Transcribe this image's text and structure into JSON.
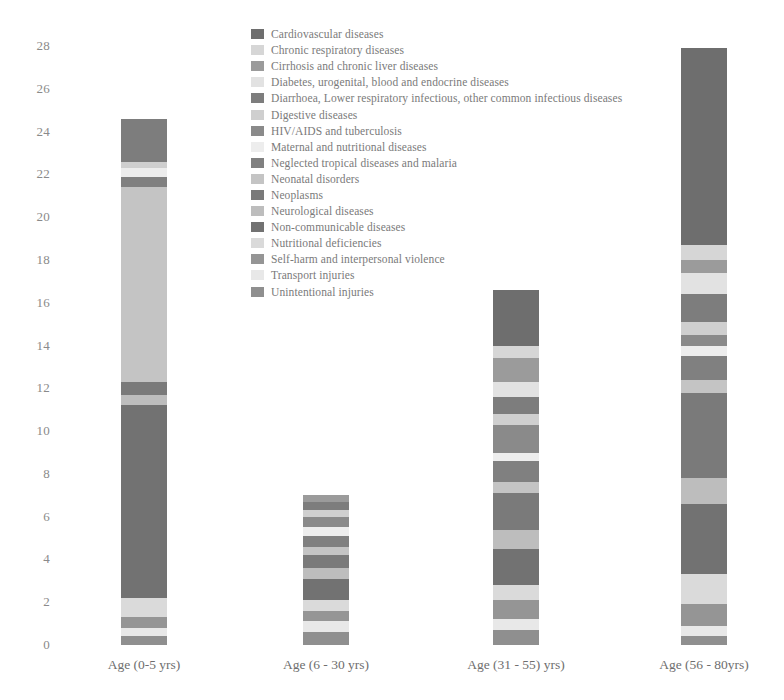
{
  "chart_data": {
    "type": "bar",
    "stacked": true,
    "title": "",
    "xlabel": "",
    "ylabel": "",
    "ylim": [
      0,
      28
    ],
    "ytick_step": 2,
    "grid": false,
    "legend_position": "top-center",
    "ytick_labels": [
      "28",
      "26",
      "24",
      "22",
      "20",
      "18",
      "16",
      "14",
      "12",
      "10",
      "8",
      "6",
      "4",
      "2",
      "0"
    ],
    "categories": [
      "Age (0-5 yrs)",
      "Age (6 - 30 yrs)",
      "Age (31 - 55) yrs)",
      "Age (56 - 80yrs)"
    ],
    "series": [
      {
        "name": "Cardiovascular diseases",
        "color": "#6e6e6e",
        "values": [
          0.0,
          0.0,
          2.6,
          9.2
        ]
      },
      {
        "name": "Chronic respiratory diseases",
        "color": "#d6d6d6",
        "values": [
          0.0,
          0.0,
          0.6,
          0.7
        ]
      },
      {
        "name": "Cirrhosis and chronic liver diseases",
        "color": "#9b9b9b",
        "values": [
          0.0,
          0.3,
          1.1,
          0.6
        ]
      },
      {
        "name": "Diabetes, urogenital, blood and endocrine diseases",
        "color": "#e2e2e2",
        "values": [
          0.0,
          0.0,
          0.7,
          1.0
        ]
      },
      {
        "name": "Diarrhoea, Lower respiratory infectious, other common infectious diseases",
        "color": "#7d7d7d",
        "values": [
          2.0,
          0.4,
          0.8,
          1.3
        ]
      },
      {
        "name": "Digestive diseases",
        "color": "#cfcfcf",
        "values": [
          0.3,
          0.3,
          0.5,
          0.6
        ]
      },
      {
        "name": "HIV/AIDS and tuberculosis",
        "color": "#8a8a8a",
        "values": [
          0.0,
          0.5,
          1.3,
          0.5
        ]
      },
      {
        "name": "Maternal and nutritional diseases",
        "color": "#ededed",
        "values": [
          0.4,
          0.4,
          0.4,
          0.5
        ]
      },
      {
        "name": "Neglected tropical diseases and malaria",
        "color": "#808080",
        "values": [
          0.5,
          0.5,
          1.0,
          1.1
        ]
      },
      {
        "name": "Neonatal disorders",
        "color": "#c4c4c4",
        "values": [
          9.1,
          0.4,
          0.5,
          0.6
        ]
      },
      {
        "name": "Neoplasms",
        "color": "#7a7a7a",
        "values": [
          0.6,
          0.6,
          1.7,
          4.0
        ]
      },
      {
        "name": "Neurological diseases",
        "color": "#bdbdbd",
        "values": [
          0.5,
          0.5,
          0.9,
          1.2
        ]
      },
      {
        "name": "Non-communicable diseases",
        "color": "#727272",
        "values": [
          9.0,
          1.0,
          1.7,
          3.3
        ]
      },
      {
        "name": "Nutritional deficiencies",
        "color": "#dadada",
        "values": [
          0.9,
          0.5,
          0.7,
          1.4
        ]
      },
      {
        "name": "Self-harm and interpersonal violence",
        "color": "#959595",
        "values": [
          0.5,
          0.5,
          0.9,
          1.0
        ]
      },
      {
        "name": "Transport injuries",
        "color": "#e8e8e8",
        "values": [
          0.4,
          0.5,
          0.5,
          0.5
        ]
      },
      {
        "name": "Unintentional injuries",
        "color": "#8f8f8f",
        "values": [
          0.4,
          0.6,
          0.7,
          0.4
        ]
      }
    ],
    "totals": [
      24.6,
      6.1,
      15.8,
      27.9
    ]
  },
  "legend": {
    "items": [
      {
        "label": "Cardiovascular diseases",
        "color": "#6e6e6e"
      },
      {
        "label": "Chronic respiratory diseases",
        "color": "#d6d6d6"
      },
      {
        "label": "Cirrhosis and chronic liver diseases",
        "color": "#9b9b9b"
      },
      {
        "label": "Diabetes, urogenital, blood and endocrine diseases",
        "color": "#e2e2e2"
      },
      {
        "label": "Diarrhoea, Lower respiratory infectious, other common infectious diseases",
        "color": "#7d7d7d"
      },
      {
        "label": "Digestive diseases",
        "color": "#cfcfcf"
      },
      {
        "label": "HIV/AIDS and tuberculosis",
        "color": "#8a8a8a"
      },
      {
        "label": "Maternal and nutritional diseases",
        "color": "#ededed"
      },
      {
        "label": "Neglected tropical diseases and malaria",
        "color": "#808080"
      },
      {
        "label": "Neonatal disorders",
        "color": "#c4c4c4"
      },
      {
        "label": "Neoplasms",
        "color": "#7a7a7a"
      },
      {
        "label": "Neurological diseases",
        "color": "#bdbdbd"
      },
      {
        "label": "Non-communicable diseases",
        "color": "#727272"
      },
      {
        "label": "Nutritional deficiencies",
        "color": "#dadada"
      },
      {
        "label": "Self-harm and interpersonal violence",
        "color": "#959595"
      },
      {
        "label": "Transport injuries",
        "color": "#e8e8e8"
      },
      {
        "label": "Unintentional injuries",
        "color": "#8f8f8f"
      }
    ]
  }
}
